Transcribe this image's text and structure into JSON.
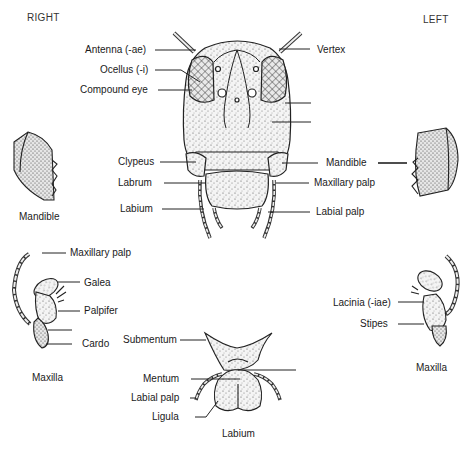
{
  "diagram": {
    "orientation": {
      "right": "RIGHT",
      "left": "LEFT"
    },
    "head_labels_left": [
      {
        "id": "antenna",
        "text": "Antenna (-ae)"
      },
      {
        "id": "ocellus",
        "text": "Ocellus (-i)"
      },
      {
        "id": "compound-eye",
        "text": "Compound eye"
      },
      {
        "id": "clypeus",
        "text": "Clypeus"
      },
      {
        "id": "labrum",
        "text": "Labrum"
      },
      {
        "id": "labium",
        "text": "Labium"
      }
    ],
    "head_labels_right": [
      {
        "id": "vertex",
        "text": "Vertex"
      },
      {
        "id": "blank-1",
        "text": ""
      },
      {
        "id": "blank-2",
        "text": ""
      },
      {
        "id": "mandible",
        "text": "Mandible"
      },
      {
        "id": "maxillary-palp",
        "text": "Maxillary palp"
      },
      {
        "id": "labial-palp",
        "text": "Labial palp"
      }
    ],
    "right_mandible_caption": "Mandible",
    "right_maxilla": {
      "caption": "Maxilla",
      "labels": [
        {
          "id": "maxillary-palp",
          "text": "Maxillary palp"
        },
        {
          "id": "galea",
          "text": "Galea"
        },
        {
          "id": "palpifer",
          "text": "Palpifer"
        },
        {
          "id": "blank",
          "text": ""
        },
        {
          "id": "cardo",
          "text": "Cardo"
        }
      ]
    },
    "left_maxilla": {
      "caption": "Maxilla",
      "labels": [
        {
          "id": "lacinia",
          "text": "Lacinia (-iae)"
        },
        {
          "id": "stipes",
          "text": "Stipes"
        }
      ]
    },
    "labium": {
      "caption": "Labium",
      "labels": [
        {
          "id": "submentum",
          "text": "Submentum"
        },
        {
          "id": "mentum",
          "text": "Mentum"
        },
        {
          "id": "labial-palp",
          "text": "Labial palp"
        },
        {
          "id": "ligula",
          "text": "Ligula"
        }
      ]
    }
  }
}
